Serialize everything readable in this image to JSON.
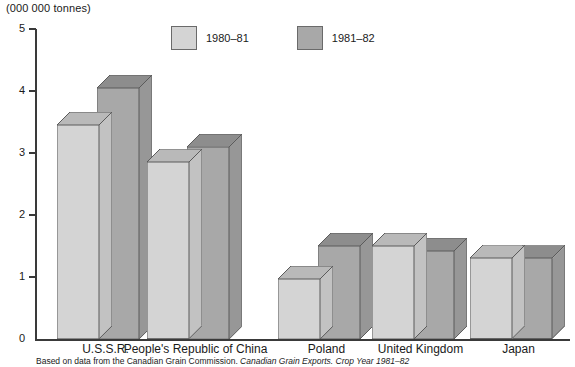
{
  "chart_data": {
    "type": "bar",
    "title": "",
    "unit_label": "(000 000 tonnes)",
    "xlabel": "",
    "ylabel": "",
    "ylim": [
      0,
      5
    ],
    "ytick_labels": [
      "0",
      "1",
      "2",
      "3",
      "4",
      "5"
    ],
    "grid": false,
    "legend_position": "top-center",
    "style": "3d-bar",
    "categories": [
      "U.S.S.R.",
      "People's Republic of China",
      "Poland",
      "United Kingdom",
      "Japan"
    ],
    "series": [
      {
        "name": "1980–81",
        "color": "#d4d4d4",
        "values": [
          3.45,
          2.85,
          0.97,
          1.5,
          1.3
        ]
      },
      {
        "name": "1981–82",
        "color": "#a8a8a8",
        "values": [
          4.05,
          3.1,
          1.5,
          1.42,
          1.3
        ]
      }
    ],
    "source_note_plain": "Based on data from the Canadian Grain Commission. ",
    "source_note_italic": "Canadian Grain Exports. Crop Year 1981–82"
  },
  "colors": {
    "series_1980_81_front": "#d4d4d4",
    "series_1980_81_top": "#b9b9b9",
    "series_1980_81_side": "#c2c2c2",
    "series_1981_82_front": "#a8a8a8",
    "series_1981_82_top": "#8d8d8d",
    "series_1981_82_side": "#979797",
    "axis": "#3a3a3a",
    "outline": "#5b5b5b",
    "background": "#ffffff"
  }
}
